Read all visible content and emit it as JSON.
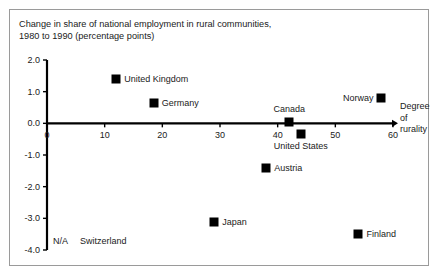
{
  "chart_data": {
    "type": "scatter",
    "title": "Change in share of national employment in rural communities,\n1980 to 1990 (percentage points)",
    "xlabel": "Degree\nof\nrurality",
    "ylabel": "",
    "xlim": [
      0,
      60
    ],
    "ylim": [
      -4.0,
      2.0
    ],
    "xticks": [
      "0",
      "10",
      "20",
      "30",
      "40",
      "50",
      "60"
    ],
    "xtick_values": [
      0,
      10,
      20,
      30,
      40,
      50,
      60
    ],
    "yticks": [
      "2.0",
      "1.0",
      "0.0",
      "-1.0",
      "-2.0",
      "-3.0",
      "-4.0"
    ],
    "ytick_values": [
      2.0,
      1.0,
      0.0,
      -1.0,
      -2.0,
      -3.0,
      -4.0
    ],
    "grid": false,
    "legend": "none",
    "zero_line": true,
    "marker_color": "#000000",
    "points": [
      {
        "label": "United Kingdom",
        "x": 12.0,
        "y": 1.4,
        "label_pos": "right"
      },
      {
        "label": "Germany",
        "x": 18.5,
        "y": 0.65,
        "label_pos": "right"
      },
      {
        "label": "Canada",
        "x": 42.0,
        "y": 0.05,
        "label_pos": "above"
      },
      {
        "label": "Norway",
        "x": 58.0,
        "y": 0.8,
        "label_pos": "left"
      },
      {
        "label": "United States",
        "x": 44.0,
        "y": -0.35,
        "label_pos": "below"
      },
      {
        "label": "Austria",
        "x": 38.0,
        "y": -1.4,
        "label_pos": "right"
      },
      {
        "label": "Japan",
        "x": 29.0,
        "y": -3.1,
        "label_pos": "right"
      },
      {
        "label": "Finland",
        "x": 54.0,
        "y": -3.5,
        "label_pos": "right"
      }
    ],
    "annotations": [
      {
        "code": "N/A",
        "text": "Switzerland"
      }
    ]
  },
  "note": {
    "na_code": "N/A",
    "na_country": "Switzerland"
  }
}
